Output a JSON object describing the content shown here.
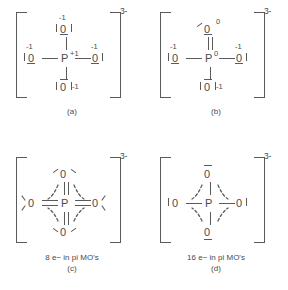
{
  "figure": {
    "ion_charge": "3-",
    "central_atom": "P",
    "ligand_atom": "O"
  },
  "panels": [
    {
      "id": "a",
      "label": "(a)",
      "caption": "",
      "central": {
        "symbol": "P",
        "formal_charge": "+1"
      },
      "oxygens": [
        {
          "position": "top",
          "symbol": "0",
          "formal_charge": "-1",
          "bond_order": 1
        },
        {
          "position": "left",
          "symbol": "0",
          "formal_charge": "-1",
          "bond_order": 1
        },
        {
          "position": "right",
          "symbol": "0",
          "formal_charge": "-1",
          "bond_order": 1
        },
        {
          "position": "bottom",
          "symbol": "0",
          "formal_charge": "-1",
          "bond_order": 1
        }
      ]
    },
    {
      "id": "b",
      "label": "(b)",
      "caption": "",
      "central": {
        "symbol": "P",
        "formal_charge": "0"
      },
      "oxygens": [
        {
          "position": "top",
          "symbol": "0",
          "formal_charge": "0",
          "bond_order": 2
        },
        {
          "position": "left",
          "symbol": "0",
          "formal_charge": "-1",
          "bond_order": 1
        },
        {
          "position": "right",
          "symbol": "0",
          "formal_charge": "-1",
          "bond_order": 1
        },
        {
          "position": "bottom",
          "symbol": "0",
          "formal_charge": "-1",
          "bond_order": 1
        }
      ]
    },
    {
      "id": "c",
      "label": "(c)",
      "caption": "8 e− in pi MO's",
      "electron_count": 8,
      "central": {
        "symbol": "P",
        "formal_charge": ""
      },
      "oxygens": [
        {
          "position": "top",
          "symbol": "0",
          "formal_charge": "",
          "bond_order": 2
        },
        {
          "position": "left",
          "symbol": "0",
          "formal_charge": "",
          "bond_order": 2
        },
        {
          "position": "right",
          "symbol": "0",
          "formal_charge": "",
          "bond_order": 2
        },
        {
          "position": "bottom",
          "symbol": "0",
          "formal_charge": "",
          "bond_order": 2
        }
      ]
    },
    {
      "id": "d",
      "label": "(d)",
      "caption": "16 e− in pi MO's",
      "electron_count": 16,
      "central": {
        "symbol": "P",
        "formal_charge": ""
      },
      "oxygens": [
        {
          "position": "top",
          "symbol": "0",
          "formal_charge": "",
          "bond_order": 1
        },
        {
          "position": "left",
          "symbol": "0",
          "formal_charge": "",
          "bond_order": 1
        },
        {
          "position": "right",
          "symbol": "0",
          "formal_charge": "",
          "bond_order": 1
        },
        {
          "position": "bottom",
          "symbol": "0",
          "formal_charge": "",
          "bond_order": 1
        }
      ]
    }
  ],
  "colors": {
    "ink": "#4a4a4a",
    "line": "#5a5a5a",
    "background": "#ffffff"
  }
}
